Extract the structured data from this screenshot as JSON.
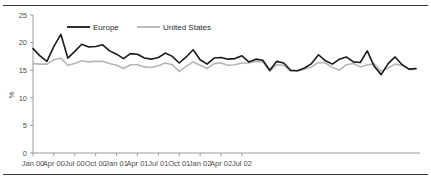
{
  "figure": {
    "name": "unemployment-rate-line-chart",
    "background": "#ffffff",
    "rule_color": "#3a3a3a"
  },
  "chart_data": {
    "type": "line",
    "title": "",
    "subtitle": "",
    "xlabel": "",
    "ylabel": "%",
    "ylim": [
      0,
      25
    ],
    "yticks": [
      0,
      5,
      10,
      15,
      20,
      25
    ],
    "ytick_labels": [
      "0",
      "5",
      "10",
      "15",
      "20",
      "25"
    ],
    "grid": false,
    "legend_position": "top-left-inside",
    "x_tick_labels": [
      "Jan 00",
      "Apr 00",
      "Jul 00",
      "Oct 00",
      "Jan 01",
      "Apr 01",
      "Jul 01",
      "Oct 01",
      "Jan 02",
      "Apr 02",
      "Jul 02"
    ],
    "x_tick_indices": [
      0,
      3,
      6,
      9,
      12,
      15,
      18,
      21,
      24,
      27,
      30
    ],
    "x": [
      "Jan 00",
      "Feb 00",
      "Mar 00",
      "Apr 00",
      "May 00",
      "Jun 00",
      "Jul 00",
      "Aug 00",
      "Sep 00",
      "Oct 00",
      "Nov 00",
      "Dec 00",
      "Jan 01",
      "Feb 01",
      "Mar 01",
      "Apr 01",
      "May 01",
      "Jun 01",
      "Jul 01",
      "Aug 01",
      "Sep 01",
      "Oct 01",
      "Nov 01",
      "Dec 01",
      "Jan 02",
      "Feb 02",
      "Mar 02",
      "Apr 02",
      "May 02",
      "Jun 02",
      "Jul 02",
      "Aug 02",
      "Sep 02"
    ],
    "series": [
      {
        "name": "Europe",
        "color": "#1a1a1a",
        "width": 1.6,
        "values": [
          18.9,
          17.6,
          16.6,
          19.3,
          21.5,
          17.2,
          18.4,
          19.7,
          19.2,
          19.3,
          19.6,
          18.5,
          17.9,
          17.1,
          18.0,
          17.9,
          17.2,
          17.0,
          17.3,
          18.1,
          17.5,
          16.3,
          17.4,
          18.7,
          16.9,
          16.1,
          17.2,
          17.3,
          17.0,
          17.1,
          17.6,
          17.2,
          16.4
        ]
      },
      {
        "name": "United States",
        "color": "#b5b5b5",
        "width": 1.6,
        "values": [
          16.2,
          16.1,
          16.1,
          16.9,
          17.2,
          15.9,
          16.2,
          16.7,
          16.5,
          16.6,
          16.6,
          16.2,
          15.9,
          15.3,
          16.0,
          16.0,
          15.6,
          15.5,
          15.8,
          16.3,
          16.0,
          14.8,
          15.7,
          16.5,
          15.9,
          15.3,
          16.2,
          16.3,
          15.9,
          16.0,
          16.4,
          16.3,
          16.0
        ]
      }
    ],
    "series_tail": {
      "note": "continuation to Sep 02",
      "Europe": [
        16.5,
        17.0,
        16.8,
        15.0,
        16.6,
        16.3,
        15.0,
        14.9,
        15.4,
        16.2,
        17.8,
        16.7,
        16.1,
        17.0,
        17.4,
        16.5,
        16.4,
        18.5,
        15.7,
        14.2,
        16.2,
        17.4,
        16.0,
        15.2,
        15.3
      ],
      "United States": [
        16.3,
        16.6,
        16.5,
        14.8,
        16.0,
        15.9,
        14.8,
        14.9,
        15.2,
        15.6,
        16.4,
        16.3,
        15.5,
        15.0,
        16.0,
        16.2,
        15.6,
        16.0,
        16.1,
        14.8,
        15.4,
        16.1,
        15.9,
        15.1,
        15.2
      ]
    },
    "europe_full": [
      18.9,
      17.6,
      16.6,
      19.3,
      21.5,
      17.2,
      18.4,
      19.7,
      19.2,
      19.3,
      19.6,
      18.5,
      17.9,
      17.1,
      18.0,
      17.9,
      17.2,
      17.0,
      17.3,
      18.1,
      17.5,
      16.3,
      17.4,
      18.7,
      16.9,
      16.1,
      17.2,
      17.3,
      17.0,
      17.1,
      17.6,
      16.5,
      17.0,
      16.8,
      15.0,
      16.6,
      16.3,
      15.0,
      14.9,
      15.4,
      16.2,
      17.8,
      16.7,
      16.1,
      17.0,
      17.4,
      16.5,
      16.4,
      18.5,
      15.7,
      14.2,
      16.2,
      17.4,
      16.0,
      15.2,
      15.3
    ],
    "us_full": [
      16.2,
      16.1,
      16.1,
      16.9,
      17.2,
      15.9,
      16.2,
      16.7,
      16.5,
      16.6,
      16.6,
      16.2,
      15.9,
      15.3,
      16.0,
      16.0,
      15.6,
      15.5,
      15.8,
      16.3,
      16.0,
      14.8,
      15.7,
      16.5,
      15.9,
      15.3,
      16.2,
      16.3,
      15.9,
      16.0,
      16.3,
      16.3,
      16.6,
      16.5,
      14.8,
      16.0,
      15.9,
      14.8,
      14.9,
      15.2,
      15.6,
      16.4,
      16.3,
      15.5,
      15.0,
      16.0,
      16.2,
      15.6,
      16.0,
      16.1,
      14.8,
      15.4,
      16.1,
      15.9,
      15.1,
      15.2
    ]
  },
  "legend": {
    "items": [
      {
        "label": "Europe",
        "color": "#1a1a1a"
      },
      {
        "label": "United States",
        "color": "#b5b5b5"
      }
    ]
  },
  "axes": {
    "y_axis_title": "%",
    "y_tick_labels": [
      "25",
      "20",
      "15",
      "10",
      "5",
      "0"
    ],
    "x_tick_labels": [
      "Jan 00",
      "Apr 00",
      "Jul 00",
      "Oct 00",
      "Jan 01",
      "Apr 01",
      "Jul 01",
      "Oct 01",
      "Jan 02",
      "Apr 02",
      "Jul 02"
    ]
  }
}
